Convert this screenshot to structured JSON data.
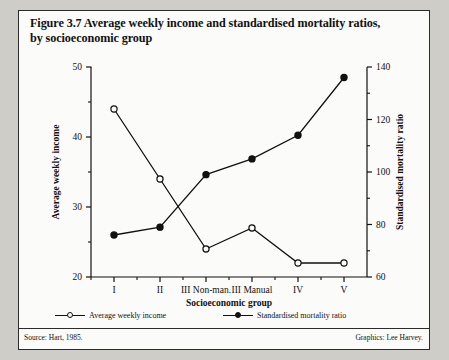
{
  "figure": {
    "number": "Figure 3.7",
    "title": "Average weekly income and standardised mortality ratios, by socioeconomic group",
    "title_line1": "Figure 3.7  Average weekly income and standardised mortality ratios,",
    "title_line2": "by socioeconomic group"
  },
  "footer": {
    "source": "Source: Hart, 1985.",
    "graphics": "Graphics: Lee Harvey."
  },
  "legend": {
    "items": [
      {
        "label": "Average weekly income",
        "marker": "open-circle"
      },
      {
        "label": "Standardised mortality ratio",
        "marker": "filled-circle"
      }
    ]
  },
  "chart_data": {
    "type": "line",
    "title": "Average weekly income and standardised mortality ratios, by socioeconomic group",
    "xlabel": "Socioeconomic group",
    "ylabel": "Average weekly income",
    "y2label": "Standardised mortality ratio",
    "categories": [
      "I",
      "II",
      "III Non-man.",
      "III Manual",
      "IV",
      "V"
    ],
    "ylim": [
      20,
      50
    ],
    "y2lim": [
      60,
      140
    ],
    "yticks": [
      20,
      30,
      40,
      50
    ],
    "yticks_minor": [
      25,
      35,
      45
    ],
    "y2ticks": [
      60,
      80,
      100,
      120,
      140
    ],
    "y2ticks_minor": [
      70,
      90,
      110,
      130
    ],
    "grid": false,
    "legend_position": "bottom",
    "series": [
      {
        "name": "Average weekly income",
        "axis": "left",
        "marker": "open-circle",
        "values": [
          44,
          34,
          24,
          27,
          22,
          22
        ]
      },
      {
        "name": "Standardised mortality ratio",
        "axis": "right",
        "marker": "filled-circle",
        "values": [
          76,
          79,
          99,
          105,
          114,
          136
        ]
      }
    ]
  }
}
